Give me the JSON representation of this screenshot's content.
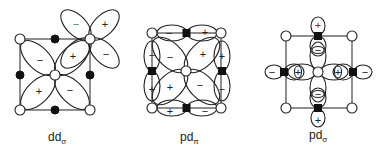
{
  "figure": {
    "panels": [
      {
        "id": "dd_sigma",
        "label_main": "dd",
        "label_sub": "σ",
        "signs": {
          "center_ul": "−",
          "center_ur": "+",
          "center_ll": "+",
          "center_lr": "−",
          "corner_ul": "−",
          "corner_ur": "+",
          "corner_lr": "−",
          "corner_ll": "+"
        }
      },
      {
        "id": "pd_pi",
        "label_main": "pd",
        "label_sub": "π",
        "signs": {
          "top_left": "−",
          "top_right": "+",
          "bottom_left": "+",
          "bottom_right": "−",
          "left_top": "−",
          "left_bottom": "+",
          "right_top": "+",
          "right_bottom": "−",
          "center_ul": "−",
          "center_ur": "+",
          "center_ll": "+",
          "center_lr": "−"
        }
      },
      {
        "id": "pd_sigma",
        "label_main": "pd",
        "label_sub": "σ",
        "signs": {
          "top_outer": "+",
          "top_inner": "−",
          "bottom_outer": "+",
          "bottom_inner": "−",
          "left_outer": "−",
          "left_inner": "+",
          "right_outer": "−",
          "right_inner": "+"
        }
      }
    ]
  }
}
